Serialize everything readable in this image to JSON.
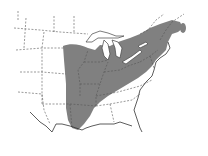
{
  "map": {
    "subject": "Range map of eastern North America",
    "region": "Eastern United States and southeastern Canada",
    "colors": {
      "background": "#ffffff",
      "range_fill": "#808080",
      "borders": "#555555",
      "lakes": "#ffffff"
    },
    "legend": null,
    "labels": []
  }
}
